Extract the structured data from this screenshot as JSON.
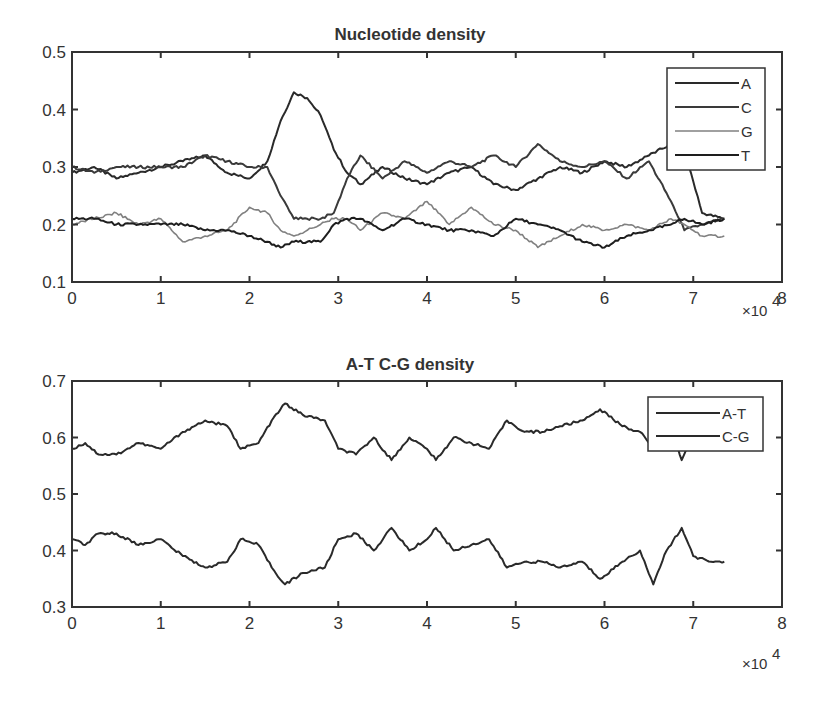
{
  "chart_data": [
    {
      "type": "line",
      "title": "Nucleotide density",
      "xlabel": "",
      "ylabel": "",
      "x_multiplier": "×10^4",
      "xlim": [
        0,
        8
      ],
      "ylim": [
        0.1,
        0.5
      ],
      "xticks": [
        "0",
        "1",
        "2",
        "3",
        "4",
        "5",
        "6",
        "7",
        "8"
      ],
      "yticks": [
        "0.1",
        "0.2",
        "0.3",
        "0.4",
        "0.5"
      ],
      "grid": false,
      "legend_position": "upper right",
      "x": [
        0,
        0.25,
        0.5,
        0.75,
        1.0,
        1.25,
        1.5,
        1.75,
        2.0,
        2.2,
        2.35,
        2.5,
        2.65,
        2.8,
        2.95,
        3.1,
        3.25,
        3.5,
        3.75,
        4.0,
        4.25,
        4.5,
        4.75,
        5.0,
        5.25,
        5.5,
        5.75,
        6.0,
        6.25,
        6.5,
        6.75,
        6.9,
        7.1,
        7.35
      ],
      "series": [
        {
          "name": "A",
          "color": "#2a2a2a",
          "values": [
            0.29,
            0.3,
            0.28,
            0.29,
            0.3,
            0.31,
            0.32,
            0.29,
            0.28,
            0.31,
            0.38,
            0.43,
            0.42,
            0.39,
            0.33,
            0.29,
            0.27,
            0.3,
            0.28,
            0.27,
            0.29,
            0.3,
            0.27,
            0.26,
            0.28,
            0.3,
            0.29,
            0.31,
            0.3,
            0.32,
            0.34,
            0.33,
            0.22,
            0.21
          ]
        },
        {
          "name": "C",
          "color": "#3a3a3a",
          "values": [
            0.3,
            0.29,
            0.3,
            0.3,
            0.3,
            0.3,
            0.32,
            0.31,
            0.3,
            0.3,
            0.25,
            0.21,
            0.21,
            0.21,
            0.22,
            0.28,
            0.32,
            0.28,
            0.31,
            0.29,
            0.31,
            0.3,
            0.32,
            0.3,
            0.34,
            0.31,
            0.3,
            0.31,
            0.28,
            0.31,
            0.24,
            0.19,
            0.2,
            0.21
          ]
        },
        {
          "name": "G",
          "color": "#808080",
          "values": [
            0.2,
            0.21,
            0.22,
            0.2,
            0.21,
            0.17,
            0.18,
            0.19,
            0.23,
            0.22,
            0.19,
            0.18,
            0.19,
            0.2,
            0.21,
            0.21,
            0.19,
            0.22,
            0.21,
            0.24,
            0.2,
            0.23,
            0.2,
            0.19,
            0.16,
            0.18,
            0.2,
            0.19,
            0.2,
            0.19,
            0.21,
            0.2,
            0.18,
            0.18
          ]
        },
        {
          "name": "T",
          "color": "#1e1e1e",
          "values": [
            0.21,
            0.21,
            0.2,
            0.2,
            0.2,
            0.2,
            0.19,
            0.19,
            0.18,
            0.17,
            0.16,
            0.17,
            0.17,
            0.17,
            0.2,
            0.21,
            0.21,
            0.19,
            0.21,
            0.2,
            0.19,
            0.19,
            0.18,
            0.21,
            0.2,
            0.19,
            0.17,
            0.16,
            0.18,
            0.19,
            0.2,
            0.21,
            0.2,
            0.21
          ]
        }
      ]
    },
    {
      "type": "line",
      "title": "A-T C-G density",
      "xlabel": "",
      "ylabel": "",
      "x_multiplier": "×10^4",
      "xlim": [
        0,
        8
      ],
      "ylim": [
        0.3,
        0.7
      ],
      "xticks": [
        "0",
        "1",
        "2",
        "3",
        "4",
        "5",
        "6",
        "7",
        "8"
      ],
      "yticks": [
        "0.3",
        "0.4",
        "0.5",
        "0.6",
        "0.7"
      ],
      "grid": false,
      "legend_position": "upper right",
      "x": [
        0,
        0.15,
        0.3,
        0.5,
        0.75,
        1.0,
        1.25,
        1.5,
        1.75,
        1.9,
        2.1,
        2.25,
        2.4,
        2.6,
        2.85,
        3.0,
        3.2,
        3.4,
        3.6,
        3.8,
        4.0,
        4.1,
        4.3,
        4.5,
        4.7,
        4.9,
        5.1,
        5.3,
        5.5,
        5.75,
        5.95,
        6.2,
        6.4,
        6.55,
        6.7,
        6.87,
        7.0,
        7.2,
        7.35
      ],
      "series": [
        {
          "name": "A-T",
          "color": "#2a2a2a",
          "values": [
            0.58,
            0.59,
            0.57,
            0.57,
            0.59,
            0.58,
            0.61,
            0.63,
            0.62,
            0.58,
            0.59,
            0.63,
            0.66,
            0.64,
            0.63,
            0.58,
            0.57,
            0.6,
            0.56,
            0.6,
            0.58,
            0.56,
            0.6,
            0.59,
            0.58,
            0.63,
            0.61,
            0.61,
            0.62,
            0.63,
            0.65,
            0.62,
            0.61,
            0.58,
            0.64,
            0.56,
            0.61,
            0.62,
            0.62
          ]
        },
        {
          "name": "C-G",
          "color": "#2a2a2a",
          "values": [
            0.42,
            0.41,
            0.43,
            0.43,
            0.41,
            0.42,
            0.39,
            0.37,
            0.38,
            0.42,
            0.41,
            0.37,
            0.34,
            0.36,
            0.37,
            0.42,
            0.43,
            0.4,
            0.44,
            0.4,
            0.42,
            0.44,
            0.4,
            0.41,
            0.42,
            0.37,
            0.38,
            0.38,
            0.37,
            0.38,
            0.35,
            0.38,
            0.4,
            0.34,
            0.4,
            0.44,
            0.39,
            0.38,
            0.38
          ]
        }
      ]
    }
  ],
  "plots": {
    "top": {
      "title": "Nucleotide density",
      "exponent_base": "×10",
      "exponent_power": "4",
      "legend": [
        "A",
        "C",
        "G",
        "T"
      ]
    },
    "bottom": {
      "title": "A-T C-G density",
      "exponent_base": "×10",
      "exponent_power": "4",
      "legend": [
        "A-T",
        "C-G"
      ]
    }
  }
}
